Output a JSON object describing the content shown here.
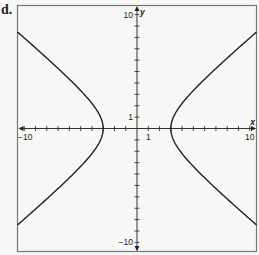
{
  "panel_label": "d.",
  "chart_data": {
    "type": "line",
    "title": "",
    "xlabel": "x",
    "ylabel": "y",
    "xlim": [
      -10.6,
      10.6
    ],
    "ylim": [
      -10.8,
      10.8
    ],
    "grid": false,
    "x_tick_step": 1,
    "y_tick_step": 1,
    "x_tick_labels": [
      {
        "value": -10,
        "text": "−10"
      },
      {
        "value": 1,
        "text": "1"
      },
      {
        "value": 10,
        "text": "10"
      }
    ],
    "y_tick_labels": [
      {
        "value": 10,
        "text": "10"
      },
      {
        "value": 1,
        "text": "1"
      },
      {
        "value": -10,
        "text": "−10"
      }
    ],
    "equation": "x^2/9 - y^2/6.25 = 1",
    "hyperbola": {
      "a": 3,
      "b": 2.5,
      "orientation": "horizontal",
      "center": [
        0,
        0
      ]
    },
    "series": [
      {
        "name": "right-branch",
        "vertex": [
          3,
          0
        ],
        "endpoints": [
          [
            10.6,
            8.5
          ],
          [
            10.6,
            -8.5
          ]
        ]
      },
      {
        "name": "left-branch",
        "vertex": [
          -3,
          0
        ],
        "endpoints": [
          [
            -10.6,
            8.5
          ],
          [
            -10.6,
            -8.5
          ]
        ]
      }
    ]
  }
}
